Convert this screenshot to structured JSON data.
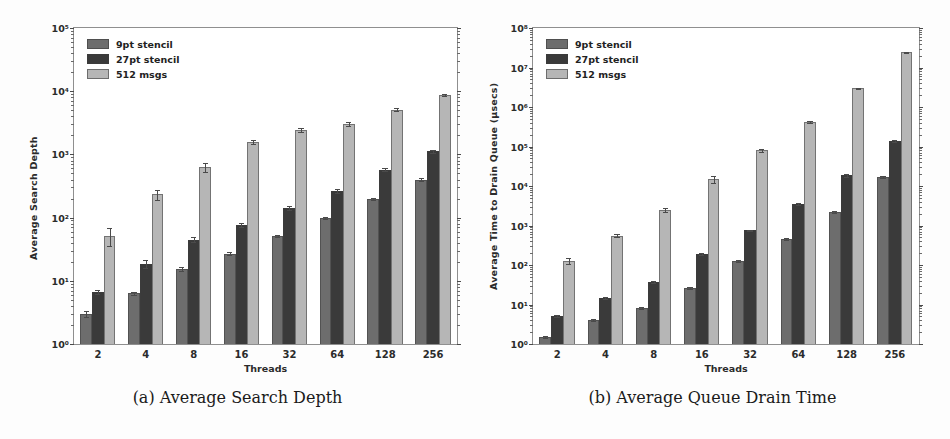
{
  "page": {
    "background": "#ffffff",
    "width": 950,
    "height": 439
  },
  "palette": {
    "series_9pt": "#6d6d6d",
    "series_27pt": "#3a3a3a",
    "series_512": "#b6b6b6",
    "axis": "#8f8f8f",
    "text": "#2b2b2b"
  },
  "figures": [
    {
      "id": "a",
      "caption": "(a) Average Search Depth",
      "chart_data": {
        "type": "bar",
        "title": "",
        "xlabel": "Threads",
        "ylabel": "Average Search Depth",
        "yscale": "log",
        "ylim": [
          1,
          100000
        ],
        "ytick_labels": [
          "10⁰",
          "10¹",
          "10²",
          "10³",
          "10⁴",
          "10⁵"
        ],
        "ytick_values": [
          1,
          10,
          100,
          1000,
          10000,
          100000
        ],
        "grid": false,
        "legend_position": "upper left",
        "categories": [
          "2",
          "4",
          "8",
          "16",
          "32",
          "64",
          "128",
          "256"
        ],
        "series": [
          {
            "name": "9pt stencil",
            "color": "#6d6d6d",
            "values": [
              3.0,
              6.3,
              15.5,
              27.0,
              51.0,
              99.0,
              195.0,
              400.0
            ],
            "errors": [
              0.35,
              0.4,
              1.3,
              1.8,
              2.0,
              3.0,
              8.0,
              18.0
            ]
          },
          {
            "name": "27pt stencil",
            "color": "#3a3a3a",
            "values": [
              6.6,
              18.5,
              45.0,
              76.0,
              142.0,
              265.0,
              570.0,
              1130.0
            ],
            "errors": [
              0.5,
              2.6,
              4.0,
              5.0,
              9.0,
              18.0,
              30.0,
              60.0
            ]
          },
          {
            "name": "512 msgs",
            "color": "#b6b6b6",
            "values": [
              52.0,
              235.0,
              630.0,
              1560.0,
              2450.0,
              3050.0,
              5100.0,
              8700.0
            ],
            "errors": [
              17.0,
              42.0,
              95.0,
              120.0,
              180.0,
              190.0,
              230.0,
              300.0
            ]
          }
        ]
      }
    },
    {
      "id": "b",
      "caption": "(b) Average Queue Drain Time",
      "chart_data": {
        "type": "bar",
        "title": "",
        "xlabel": "Threads",
        "ylabel": "Average Time to Drain Queue (μsecs)",
        "yscale": "log",
        "ylim": [
          1,
          100000000
        ],
        "ytick_labels": [
          "10⁰",
          "10¹",
          "10²",
          "10³",
          "10⁴",
          "10⁵",
          "10⁶",
          "10⁷",
          "10⁸"
        ],
        "ytick_values": [
          1,
          10,
          100,
          1000,
          10000,
          100000,
          1000000,
          10000000,
          100000000
        ],
        "grid": false,
        "legend_position": "upper left",
        "categories": [
          "2",
          "4",
          "8",
          "16",
          "32",
          "64",
          "128",
          "256"
        ],
        "series": [
          {
            "name": "9pt stencil",
            "color": "#6d6d6d",
            "values": [
              1.5,
              4.0,
              8.0,
              26.0,
              125.0,
              450.0,
              2200.0,
              17000.0
            ],
            "errors": [
              0.1,
              0.2,
              0.4,
              1.5,
              6.0,
              25.0,
              120.0,
              900.0
            ]
          },
          {
            "name": "27pt stencil",
            "color": "#3a3a3a",
            "values": [
              5.0,
              15.0,
              37.0,
              190.0,
              750.0,
              3600.0,
              18500.0,
              135000.0
            ],
            "errors": [
              0.3,
              0.9,
              2.0,
              12.0,
              40.0,
              200.0,
              1200.0,
              7000.0
            ]
          },
          {
            "name": "512 msgs",
            "color": "#b6b6b6",
            "values": [
              125.0,
              550.0,
              2500.0,
              15000.0,
              80000.0,
              420000.0,
              3000000.0,
              24000000.0
            ],
            "errors": [
              22.0,
              50.0,
              250.0,
              3000.0,
              6000.0,
              20000.0,
              100000.0,
              700000.0
            ]
          }
        ]
      }
    }
  ]
}
